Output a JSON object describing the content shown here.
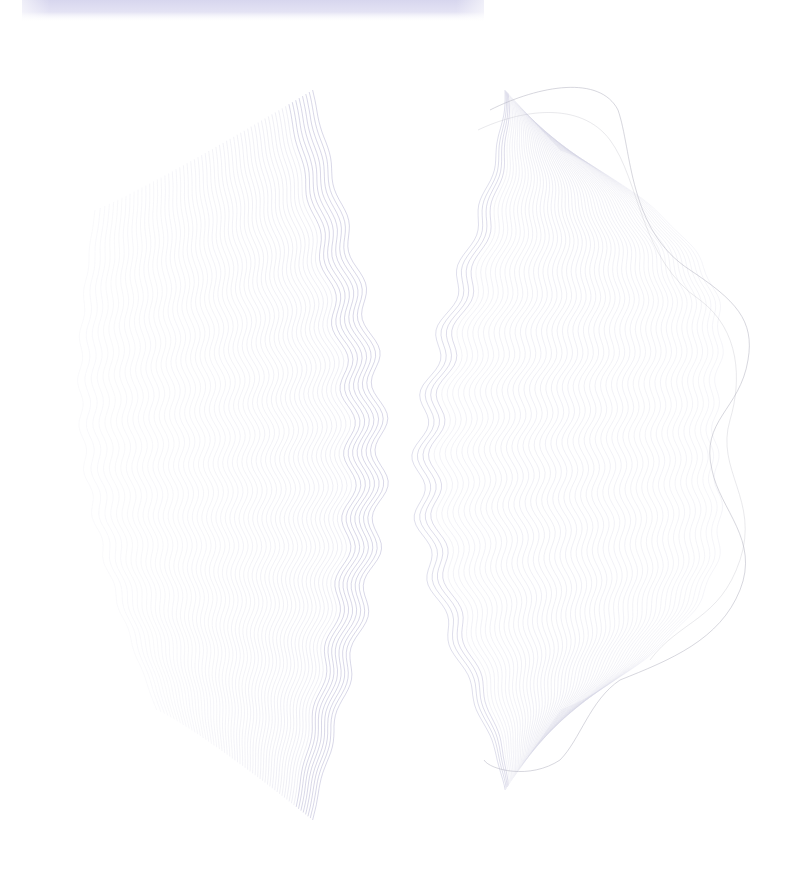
{
  "canvas": {
    "width": 808,
    "height": 878,
    "background": "#ffffff"
  },
  "top_band": {
    "x": 22,
    "y": 0,
    "width": 462,
    "height": 22,
    "color_top": "#d9d8ee",
    "color_mid": "#e6e6f5"
  },
  "colors": {
    "line_light": "#d4d4e4",
    "line_accent": "#8a88b8",
    "line_grey": "#b8b8c4"
  },
  "left_fan": {
    "count": 60,
    "top_y": 70,
    "bottom_y": 820,
    "center_x": 385,
    "min_x": 45,
    "waves": 11,
    "amplitude": 7
  },
  "right_fan": {
    "count": 55,
    "top_y": 65,
    "bottom_y": 810,
    "center_x": 425,
    "max_x": 760,
    "waves": 11,
    "amplitude": 7
  }
}
